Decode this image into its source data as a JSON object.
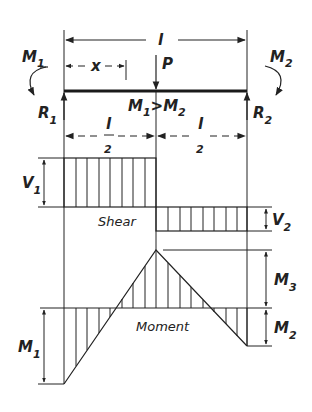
{
  "diagram": {
    "labels": {
      "span": "l",
      "x": "x",
      "load": "P",
      "m1_top": "M",
      "m1_top_sub": "1",
      "m2_top": "M",
      "m2_top_sub": "2",
      "r1": "R",
      "r1_sub": "1",
      "r2": "R",
      "r2_sub": "2",
      "condition_m1": "M",
      "condition_m1_sub": "1",
      "condition_op": ">",
      "condition_m2": "M",
      "condition_m2_sub": "2",
      "half_left_num": "l",
      "half_left_den": "2",
      "half_right_num": "l",
      "half_right_den": "2",
      "v1": "V",
      "v1_sub": "1",
      "v2": "V",
      "v2_sub": "2",
      "shear": "Shear",
      "moment": "Moment",
      "m3": "M",
      "m3_sub": "3",
      "m2_diag": "M",
      "m2_diag_sub": "2",
      "m1_diag": "M",
      "m1_diag_sub": "1"
    },
    "geometry": {
      "beam_left_x": 64,
      "beam_right_x": 247,
      "beam_y": 91,
      "load_x": 156,
      "shear_baseline_y": 207,
      "v1_top_y": 158,
      "v2_bottom_y": 231,
      "moment_baseline_y": 308,
      "m3_peak_y": 250,
      "m1_bottom_y": 384,
      "m2_bottom_y": 346
    },
    "colors": {
      "ink": "#222222",
      "background": "#ffffff"
    }
  }
}
